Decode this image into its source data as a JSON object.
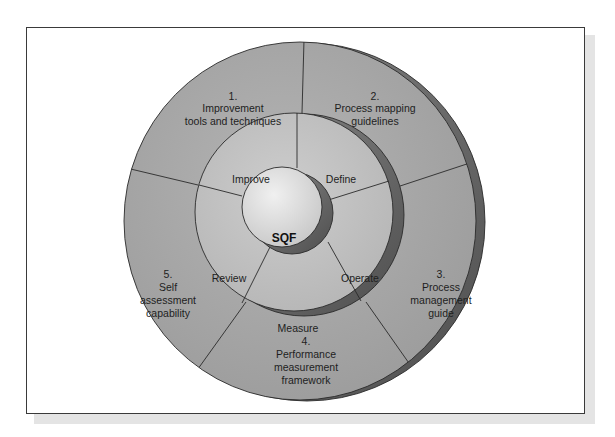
{
  "diagram": {
    "center": {
      "label": "SQF"
    },
    "inner_cycle": [
      {
        "label": "Improve"
      },
      {
        "label": "Define"
      },
      {
        "label": "Operate"
      },
      {
        "label": "Measure"
      },
      {
        "label": "Review"
      }
    ],
    "outer_components": [
      {
        "number": "1.",
        "lines": [
          "Improvement",
          "tools and techniques"
        ]
      },
      {
        "number": "2.",
        "lines": [
          "Process mapping",
          "guidelines"
        ]
      },
      {
        "number": "3.",
        "lines": [
          "Process",
          "management",
          "guide"
        ]
      },
      {
        "number": "4.",
        "lines": [
          "Performance",
          "measurement",
          "framework"
        ]
      },
      {
        "number": "5.",
        "lines": [
          "Self",
          "assessment",
          "capability"
        ]
      }
    ],
    "colors": {
      "outer_ring": "#a9a9a9",
      "middle_ring": "#c4c4c4",
      "center_circle": "#dedede",
      "extrusion": "#6e6e6e",
      "line": "#2a2a2a"
    }
  }
}
